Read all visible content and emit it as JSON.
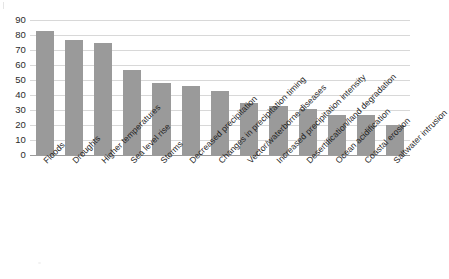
{
  "chart_data": {
    "type": "bar",
    "title": "",
    "subtitle": "",
    "xlabel": "",
    "ylabel": "",
    "ylim": [
      0,
      90
    ],
    "ytick_step": 10,
    "yticks": [
      90,
      80,
      70,
      60,
      50,
      40,
      30,
      20,
      10,
      0
    ],
    "ytick_labels": [
      "90",
      "80",
      "70",
      "60",
      "50",
      "40",
      "30",
      "20",
      "10",
      "0"
    ],
    "grid": true,
    "grid_axis": "y",
    "legend": false,
    "legend_position": "none",
    "bar_color": "#9a9a9a",
    "gridline_color": "#d8d8d8",
    "axis_color": "#9b9b9b",
    "background_color": "#ffffff",
    "xtick_label_rotation": -45,
    "categories": [
      "Floods",
      "Droughts",
      "Higher temperatures",
      "Sea level rise",
      "Storms",
      "Decreased precipitation",
      "Changes in precipitation timing",
      "Vector/waterborne diseases",
      "Increased precipitation intensity",
      "Desertification/land degradation",
      "Ocean acidification",
      "Coastal erosion",
      "Saltwater intrusion"
    ],
    "values": [
      83,
      77,
      75,
      57,
      48,
      46,
      43,
      35,
      33,
      31,
      27,
      27,
      20
    ]
  }
}
